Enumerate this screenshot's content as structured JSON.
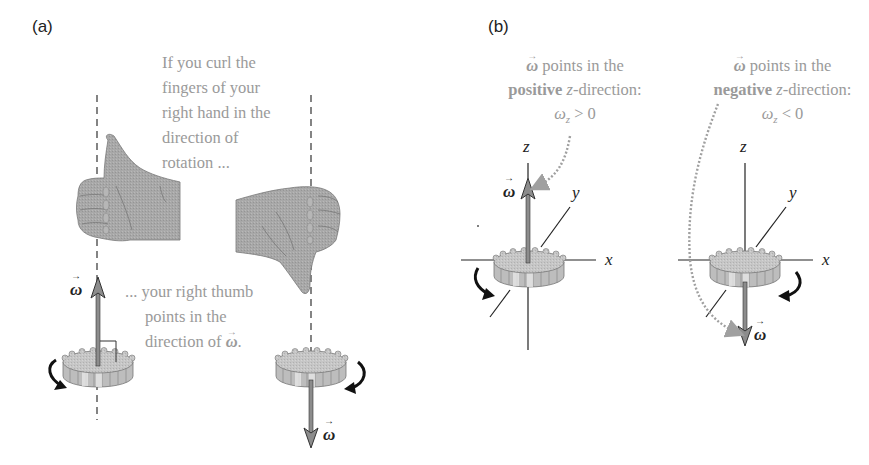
{
  "panels": {
    "a": {
      "label": "(a)",
      "note_top": [
        "If you curl the",
        "fingers of your",
        "right hand in the",
        "direction of",
        "rotation ..."
      ],
      "note_bottom": [
        "... your right thumb",
        "points in the",
        "direction of"
      ],
      "note_bottom_symbol": "ω",
      "note_bottom_end": ".",
      "omega_up_label": "ω",
      "omega_down_label": "ω"
    },
    "b": {
      "label": "(b)",
      "left": {
        "line1_symbol": "ω",
        "line1_rest": " points in the",
        "line2_bold": "positive",
        "line2_rest_italic": "z",
        "line2_rest": "-direction:",
        "line3": "ω",
        "line3_sub": "z",
        "line3_rel": " > 0",
        "axes": {
          "z": "z",
          "y": "y",
          "x": "x"
        },
        "omega_label": "ω"
      },
      "right": {
        "line1_symbol": "ω",
        "line1_rest": " points in the",
        "line2_bold": "negative",
        "line2_rest_italic": "z",
        "line2_rest": "-direction:",
        "line3": "ω",
        "line3_sub": "z",
        "line3_rel": " < 0",
        "axes": {
          "z": "z",
          "y": "y",
          "x": "x"
        },
        "omega_label": "ω"
      }
    }
  },
  "colors": {
    "note_text": "#9a9a9a",
    "hand_fill": "#a9a9a9",
    "gear_fill": "#c4c4c4",
    "arrow_fill": "#8c8c8c",
    "dotted_arrow": "#a0a0a0",
    "line": "#222222"
  }
}
